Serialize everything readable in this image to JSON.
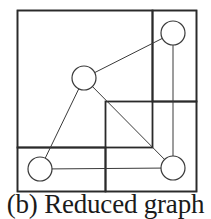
{
  "caption": "(b) Reduced graph",
  "colors": {
    "stroke": "#3a3a3a",
    "partition_stroke": "#2a2a2a",
    "background": "#ffffff",
    "node_fill": "#ffffff"
  },
  "diagram": {
    "type": "partitioned-graph",
    "outer_box": {
      "x": 17,
      "y": 10,
      "w": 179,
      "h": 181
    },
    "regions": [
      {
        "id": "top-left",
        "x": 17,
        "y": 10,
        "w": 135,
        "h": 137
      },
      {
        "id": "top-right",
        "x": 152,
        "y": 10,
        "w": 44,
        "h": 91
      },
      {
        "id": "bottom-right",
        "x": 105,
        "y": 101,
        "w": 91,
        "h": 90
      },
      {
        "id": "bottom-left",
        "x": 17,
        "y": 147,
        "w": 88,
        "h": 44
      }
    ],
    "nodes": [
      {
        "id": "n-top-right",
        "cx": 173,
        "cy": 33,
        "r": 12
      },
      {
        "id": "n-center",
        "cx": 84,
        "cy": 78,
        "r": 12
      },
      {
        "id": "n-bottom-left",
        "cx": 40,
        "cy": 169,
        "r": 12
      },
      {
        "id": "n-bottom-right",
        "cx": 173,
        "cy": 168,
        "r": 12
      }
    ],
    "edges": [
      {
        "from": "n-center",
        "to": "n-top-right"
      },
      {
        "from": "n-center",
        "to": "n-bottom-left"
      },
      {
        "from": "n-center",
        "to": "n-bottom-right"
      },
      {
        "from": "n-top-right",
        "to": "n-bottom-right"
      },
      {
        "from": "n-bottom-left",
        "to": "n-bottom-right"
      }
    ]
  }
}
